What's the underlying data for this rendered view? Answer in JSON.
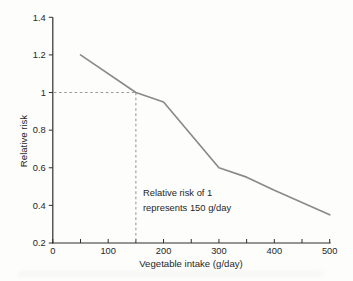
{
  "chart_data": {
    "type": "line",
    "title": "",
    "xlabel": "Vegetable intake (g/day)",
    "ylabel": "Relative risk",
    "xlim": [
      0,
      500
    ],
    "ylim": [
      0.2,
      1.4
    ],
    "x_major_ticks": [
      0,
      100,
      200,
      300,
      400,
      500
    ],
    "x_major_tick_labels": [
      "0",
      "100",
      "200",
      "300",
      "400",
      "500"
    ],
    "x_minor_ticks": [
      50,
      150,
      250,
      350,
      450
    ],
    "y_ticks": [
      0.2,
      0.4,
      0.6,
      0.8,
      1,
      1.2,
      1.4
    ],
    "y_tick_labels": [
      "0.2",
      "0.4",
      "0.6",
      "0.8",
      "1",
      "1.2",
      "1.4"
    ],
    "grid": false,
    "legend": false,
    "series": [
      {
        "name": "relative-risk-vs-vegetable-intake",
        "x": [
          50,
          150,
          200,
          300,
          350,
          400,
          500
        ],
        "y": [
          1.2,
          1.0,
          0.95,
          0.6,
          0.55,
          0.48,
          0.35
        ]
      }
    ],
    "reference_lines": {
      "y_value": 1,
      "x_value": 150,
      "style": "dashed"
    },
    "annotation": {
      "line1": "Relative risk of 1",
      "line2": "represents 150 g/day"
    }
  },
  "colors": {
    "axis": "#2f2f2f",
    "text": "#262626",
    "curve": "#8a8a8a",
    "dash": "#9b9b9b",
    "background": "#fdfdfc"
  }
}
